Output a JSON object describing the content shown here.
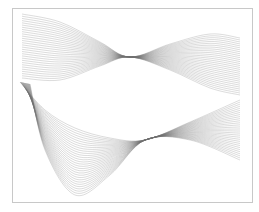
{
  "figure": {
    "frame": {
      "x": 12,
      "y": 8,
      "width": 240,
      "height": 194,
      "stroke": "#c8c8c8"
    },
    "line_color": "#6e6e6e",
    "line_opacity": 0.55
  },
  "chart_data": {
    "type": "line",
    "title": "",
    "xlabel": "",
    "ylabel": "",
    "grid": false,
    "legend": null,
    "axes_visible": false,
    "series": [
      {
        "name": "upper-wave-family",
        "count": 30,
        "x": [
          22,
          60,
          100,
          130,
          170,
          210,
          240
        ],
        "y_top_curve": [
          14,
          22,
          42,
          57,
          44,
          34,
          38
        ],
        "y_bottom_curve": [
          78,
          80,
          66,
          57,
          70,
          88,
          95
        ]
      },
      {
        "name": "lower-wave-family",
        "count": 30,
        "x": [
          20,
          45,
          75,
          110,
          145,
          190,
          240
        ],
        "y_top_curve": [
          82,
          110,
          128,
          138,
          140,
          122,
          100
        ],
        "y_bottom_curve": [
          84,
          150,
          195,
          175,
          140,
          140,
          160
        ]
      }
    ]
  }
}
